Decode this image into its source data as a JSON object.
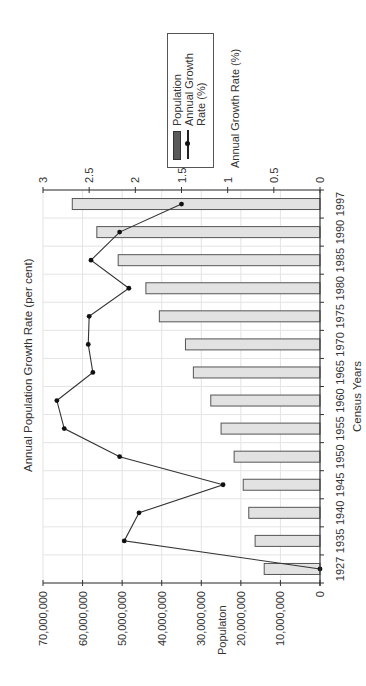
{
  "chart_data": {
    "type": "bar",
    "orientation": "rotated-90-counterclockwise",
    "title": "Annual Population Growth Rate (per cent)",
    "xlabel": "Census Years",
    "ylabel": "Populaton",
    "y2label": "Annual Growth Rate (%)",
    "categories": [
      "1927",
      "1935",
      "1940",
      "1945",
      "1950",
      "1955",
      "1960",
      "1965",
      "1970",
      "1975",
      "1980",
      "1985",
      "1990",
      "1997"
    ],
    "series": [
      {
        "name": "Population",
        "type": "bar",
        "axis": "left",
        "values": [
          14100000,
          16400000,
          18000000,
          19400000,
          21700000,
          25000000,
          27600000,
          32000000,
          34000000,
          40600000,
          44000000,
          51000000,
          56400000,
          62600000
        ]
      },
      {
        "name": "Annual Growth Rate (%)",
        "type": "line",
        "axis": "right",
        "values": [
          0,
          2.12,
          1.96,
          1.05,
          2.17,
          2.77,
          2.85,
          2.46,
          2.51,
          2.5,
          2.07,
          2.48,
          2.17,
          1.5
        ]
      }
    ],
    "ylim": [
      0,
      70000000
    ],
    "y2lim": [
      0,
      3
    ],
    "yticks": [
      "0",
      "10,000,000",
      "20,000,000",
      "30,000,000",
      "40,000,000",
      "50,000,000",
      "60,000,000",
      "70,000,000"
    ],
    "y2ticks": [
      "0",
      "0.5",
      "1",
      "1.5",
      "2",
      "2.5",
      "3"
    ],
    "grid": true,
    "legend_position": "top-right",
    "colors": {
      "bar_fill": "#e2e2e2",
      "bar_stroke": "#555555",
      "line": "#333333",
      "grid": "#e4e4e4",
      "legend_swatch": "#5a5a5a"
    }
  },
  "legend": {
    "items": [
      "Population",
      "Annual Growth",
      "Rate (%)"
    ]
  },
  "labels": {
    "title": "Annual Population Growth Rate (per cent)",
    "x_axis": "Census Years",
    "y_axis": "Populaton",
    "y2_axis": "Annual Growth Rate (%)"
  }
}
